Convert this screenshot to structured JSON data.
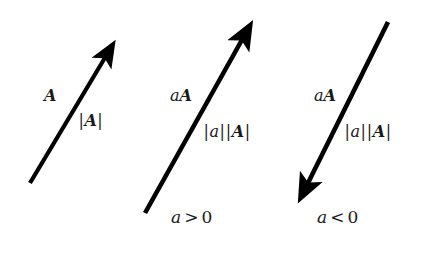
{
  "figure": {
    "background_color": "#ffffff",
    "ink_color": "#000000",
    "text_color": "#1a1a1a",
    "width": 426,
    "height": 254
  },
  "vectors": [
    {
      "id": "vector-A",
      "name_label": "A",
      "name_parts": {
        "scalar": "",
        "vector": "A"
      },
      "magnitude_label": "|A|",
      "magnitude_parts": {
        "scalar": "",
        "vector": "A"
      },
      "caption": "",
      "direction": "up-right",
      "x1": 30,
      "y1": 183,
      "x2": 112,
      "y2": 44,
      "stroke_width": 4.2
    },
    {
      "id": "vector-aA-positive",
      "name_label": "aA",
      "name_parts": {
        "scalar": "a",
        "vector": "A"
      },
      "magnitude_label": "|a||A|",
      "magnitude_parts": {
        "scalar": "a",
        "vector": "A"
      },
      "caption": "a > 0",
      "caption_parts": {
        "symbol": "a",
        "relation": ">",
        "value": "0"
      },
      "direction": "up-right",
      "x1": 145,
      "y1": 213,
      "x2": 251,
      "y2": 23,
      "stroke_width": 4.6
    },
    {
      "id": "vector-aA-negative",
      "name_label": "aA",
      "name_parts": {
        "scalar": "a",
        "vector": "A"
      },
      "magnitude_label": "|a||A|",
      "magnitude_parts": {
        "scalar": "a",
        "vector": "A"
      },
      "caption": "a < 0",
      "caption_parts": {
        "symbol": "a",
        "relation": "<",
        "value": "0"
      },
      "direction": "down-left",
      "x1": 388,
      "y1": 22,
      "x2": 300,
      "y2": 201,
      "stroke_width": 4.6
    }
  ],
  "labels": {
    "v1_name": "A",
    "v1_mag_scalar": "",
    "v1_mag_vector": "A",
    "v2_name_scalar": "a",
    "v2_name_vector": "A",
    "v2_mag_scalar": "a",
    "v2_mag_vector": "A",
    "v2_caption_symbol": "a",
    "v2_caption_relation": ">",
    "v2_caption_value": "0",
    "v3_name_scalar": "a",
    "v3_name_vector": "A",
    "v3_mag_scalar": "a",
    "v3_mag_vector": "A",
    "v3_caption_symbol": "a",
    "v3_caption_relation": "<",
    "v3_caption_value": "0",
    "bar": "|"
  }
}
